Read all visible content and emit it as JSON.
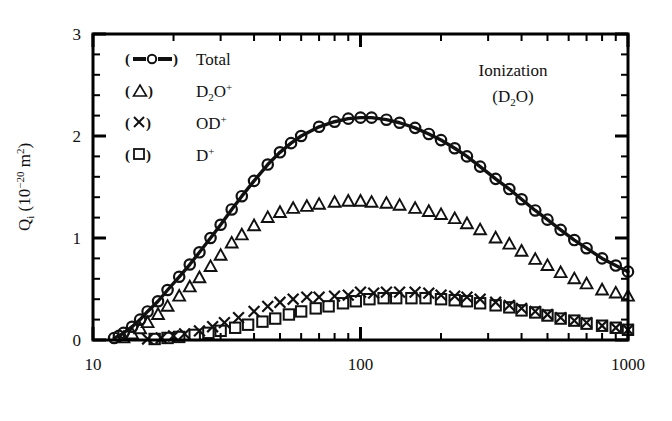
{
  "chart_data": {
    "type": "scatter",
    "title": "",
    "annotation": [
      "Ionization",
      "(D2O)"
    ],
    "annotation_display": [
      "Ionization",
      "(D₂O)"
    ],
    "xlabel": "Energy (eV)",
    "ylabel": "Qi (10-20 m2)",
    "ylabel_display": "Qᵢ (10⁻²⁰ m²)",
    "xscale": "log",
    "yscale": "linear",
    "xlim": [
      10,
      1000
    ],
    "ylim": [
      0,
      3
    ],
    "xticks": [
      10,
      100,
      1000
    ],
    "xticklabels": [
      "10",
      "100",
      "1000"
    ],
    "yticks": [
      0,
      1,
      2,
      3
    ],
    "yticklabels": [
      "0",
      "1",
      "2",
      "3"
    ],
    "grid": false,
    "frame": "box",
    "tick_direction": "in",
    "legend_position": "upper-left",
    "legend": [
      {
        "marker": "circle-line",
        "label": "Total",
        "label_display": "Total"
      },
      {
        "marker": "triangle",
        "label": "D2O+",
        "label_display": "D₂O⁺"
      },
      {
        "marker": "cross",
        "label": "OD+",
        "label_display": "OD⁺"
      },
      {
        "marker": "square",
        "label": "D+",
        "label_display": "D⁺"
      }
    ],
    "series": [
      {
        "name": "Total",
        "marker": "circle-line",
        "x": [
          12,
          12.5,
          13,
          14,
          15,
          16,
          17.5,
          19,
          21,
          23,
          25,
          27.5,
          30,
          33,
          36,
          40,
          45,
          50,
          55,
          60,
          70,
          80,
          90,
          100,
          110,
          125,
          140,
          160,
          180,
          200,
          225,
          250,
          280,
          320,
          360,
          400,
          450,
          500,
          560,
          630,
          700,
          800,
          900,
          1000
        ],
        "y": [
          0.02,
          0.04,
          0.07,
          0.13,
          0.2,
          0.28,
          0.38,
          0.49,
          0.62,
          0.74,
          0.86,
          1.0,
          1.13,
          1.28,
          1.41,
          1.56,
          1.72,
          1.84,
          1.93,
          2.0,
          2.09,
          2.14,
          2.17,
          2.18,
          2.18,
          2.16,
          2.13,
          2.08,
          2.02,
          1.96,
          1.88,
          1.8,
          1.7,
          1.58,
          1.48,
          1.38,
          1.27,
          1.18,
          1.08,
          0.98,
          0.9,
          0.8,
          0.73,
          0.67
        ]
      },
      {
        "name": "D2O+",
        "marker": "triangle",
        "x": [
          13,
          14,
          15,
          16,
          17.5,
          19,
          21,
          23,
          25,
          27.5,
          30,
          33,
          36,
          40,
          45,
          50,
          56,
          63,
          70,
          80,
          90,
          100,
          110,
          125,
          140,
          160,
          180,
          200,
          225,
          250,
          280,
          320,
          360,
          400,
          450,
          500,
          560,
          630,
          700,
          800,
          900,
          1000
        ],
        "y": [
          0.02,
          0.06,
          0.11,
          0.17,
          0.25,
          0.33,
          0.43,
          0.52,
          0.61,
          0.72,
          0.83,
          0.95,
          1.03,
          1.12,
          1.2,
          1.25,
          1.29,
          1.31,
          1.33,
          1.35,
          1.36,
          1.36,
          1.35,
          1.34,
          1.32,
          1.29,
          1.26,
          1.23,
          1.19,
          1.14,
          1.08,
          1.0,
          0.94,
          0.87,
          0.79,
          0.73,
          0.66,
          0.6,
          0.55,
          0.49,
          0.46,
          0.43
        ]
      },
      {
        "name": "OD+",
        "marker": "cross",
        "x": [
          16,
          18,
          20,
          22,
          25,
          28,
          31,
          35,
          40,
          45,
          50,
          56,
          63,
          70,
          80,
          90,
          100,
          112,
          125,
          140,
          160,
          180,
          200,
          225,
          250,
          280,
          320,
          360,
          400,
          450,
          500,
          560,
          630,
          700,
          800,
          900,
          1000
        ],
        "y": [
          0.01,
          0.02,
          0.04,
          0.06,
          0.09,
          0.13,
          0.17,
          0.22,
          0.28,
          0.33,
          0.37,
          0.4,
          0.42,
          0.42,
          0.43,
          0.44,
          0.47,
          0.46,
          0.47,
          0.47,
          0.47,
          0.46,
          0.44,
          0.43,
          0.42,
          0.4,
          0.37,
          0.34,
          0.31,
          0.28,
          0.25,
          0.22,
          0.19,
          0.17,
          0.14,
          0.12,
          0.1
        ]
      },
      {
        "name": "D+",
        "marker": "square",
        "x": [
          17,
          19,
          21,
          24,
          27,
          30,
          34,
          38,
          43,
          48,
          54,
          60,
          68,
          76,
          86,
          96,
          108,
          122,
          136,
          155,
          175,
          200,
          225,
          250,
          280,
          320,
          360,
          400,
          450,
          500,
          560,
          630,
          700,
          800,
          900,
          1000
        ],
        "y": [
          0.01,
          0.02,
          0.03,
          0.05,
          0.07,
          0.09,
          0.12,
          0.15,
          0.18,
          0.21,
          0.25,
          0.28,
          0.31,
          0.33,
          0.36,
          0.38,
          0.4,
          0.41,
          0.41,
          0.41,
          0.41,
          0.4,
          0.39,
          0.38,
          0.36,
          0.34,
          0.32,
          0.29,
          0.27,
          0.24,
          0.21,
          0.19,
          0.16,
          0.14,
          0.12,
          0.1
        ]
      }
    ],
    "colors": {
      "line": "#111111",
      "marker": "#111111",
      "frame": "#000000"
    }
  }
}
